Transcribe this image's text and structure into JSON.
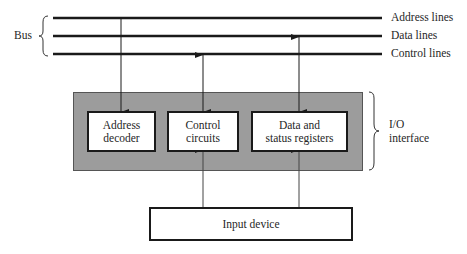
{
  "diagram": {
    "bus": {
      "label": "Bus",
      "lines": [
        {
          "label": "Address lines"
        },
        {
          "label": "Data lines"
        },
        {
          "label": "Control lines"
        }
      ]
    },
    "io_interface": {
      "label_line1": "I/O",
      "label_line2": "interface",
      "fill_color": "#9c9c9c",
      "blocks": [
        {
          "line1": "Address",
          "line2": "decoder"
        },
        {
          "line1": "Control",
          "line2": "circuits"
        },
        {
          "line1": "Data and",
          "line2": "status registers"
        }
      ]
    },
    "device": {
      "label": "Input device"
    }
  }
}
